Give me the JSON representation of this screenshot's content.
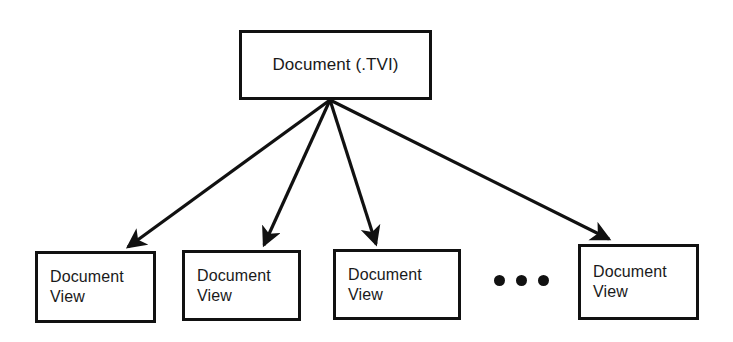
{
  "diagram": {
    "type": "fan-out-hierarchy",
    "background_color": "#ffffff",
    "line_color": "#111111",
    "root": {
      "label": "Document (.TVI)",
      "x": 239,
      "y": 30,
      "width": 193,
      "height": 70
    },
    "fan_origin": {
      "x": 330,
      "y": 100
    },
    "leaves": [
      {
        "label": "Document\nView",
        "x": 35,
        "y": 251,
        "width": 121,
        "height": 72
      },
      {
        "label": "Document\nView",
        "x": 182,
        "y": 250,
        "width": 119,
        "height": 71
      },
      {
        "label": "Document\nView",
        "x": 333,
        "y": 249,
        "width": 128,
        "height": 71
      },
      {
        "label": "Document\nView",
        "x": 578,
        "y": 244,
        "width": 121,
        "height": 76
      }
    ],
    "arrows": [
      {
        "from_x": 330,
        "from_y": 100,
        "to_x": 126,
        "to_y": 249
      },
      {
        "from_x": 330,
        "from_y": 100,
        "to_x": 263,
        "to_y": 247
      },
      {
        "from_x": 330,
        "from_y": 100,
        "to_x": 376,
        "to_y": 246
      },
      {
        "from_x": 330,
        "from_y": 100,
        "to_x": 611,
        "to_y": 241
      }
    ],
    "ellipsis": {
      "dot_count": 3,
      "x": 494,
      "y": 275
    }
  }
}
